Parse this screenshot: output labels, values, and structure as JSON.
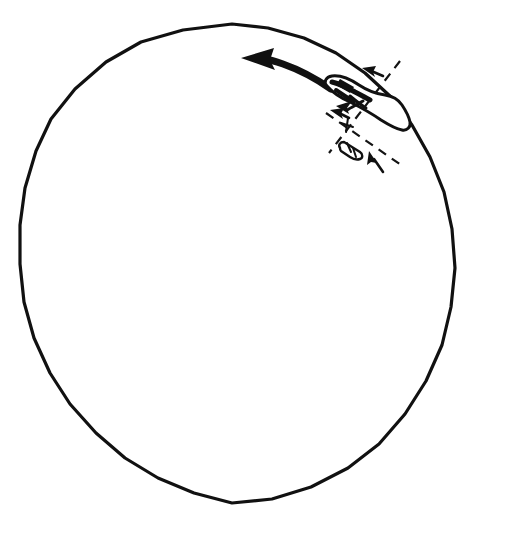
{
  "figure": {
    "background_color": "#ffffff",
    "ink_color": "#111111",
    "width": 505,
    "height": 546
  },
  "elements": {
    "boundary": {
      "name": "large hand-drawn polygonal circle",
      "shape": "irregular polygon approximating a circle",
      "stroke_width": 3,
      "center": [
        232,
        276
      ],
      "radius": 218
    },
    "motion_arrow": {
      "name": "thick curved arrow",
      "direction": "left",
      "description": "bold curved arrow sweeping leftwards across the upper area",
      "stroke_width": 7
    },
    "island": {
      "name": "irregular elongated blob outline",
      "description": "island-like closed contour with heavy internal strokes",
      "stroke_width": 3
    },
    "capsule": {
      "name": "small segmented capsule object",
      "segments": 3,
      "stroke_width": 2
    },
    "dashed_line_a": {
      "name": "dashed axis running upper-right to lower-left",
      "dash_pattern": "9 7",
      "stroke_width": 2
    },
    "dashed_line_b": {
      "name": "dashed axis running upper-left to lower-right",
      "dash_pattern": "9 7",
      "stroke_width": 2
    },
    "tick_arrow_upper": {
      "name": "small arrow pointing down-left",
      "direction": "down-left"
    },
    "tick_arrow_mid": {
      "name": "small arrow pointing down-left toward crossing",
      "direction": "down-left"
    },
    "tick_arrow_lower": {
      "name": "small arrow pointing up-left",
      "direction": "up-left"
    },
    "crossing_marker": {
      "name": "small cross tick at dashed line intersection",
      "position": [
        347,
        124
      ]
    }
  }
}
